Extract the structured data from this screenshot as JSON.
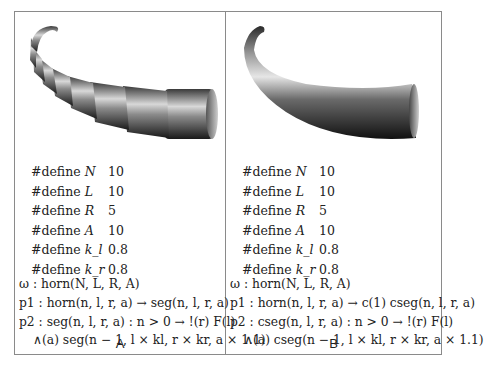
{
  "figure": {
    "panels": [
      {
        "label": "A",
        "render_description": "segmented horn built from discrete cylinder segments",
        "defines": [
          {
            "keyword": "#define",
            "symbol": "N",
            "value": "10"
          },
          {
            "keyword": "#define",
            "symbol": "L",
            "value": "10"
          },
          {
            "keyword": "#define",
            "symbol": "R",
            "value": "5"
          },
          {
            "keyword": "#define",
            "symbol": "A",
            "value": "10"
          },
          {
            "keyword": "#define",
            "symbol": "k_l",
            "value": "0.8"
          },
          {
            "keyword": "#define",
            "symbol": "k_r",
            "value": "0.8"
          }
        ],
        "productions": [
          "ω : horn(N, L, R, A)",
          "p1 : horn(n, l, r, a) → seg(n, l, r, a)",
          "p2 : seg(n, l, r, a) : n > 0 → !(r) F(l)",
          "∧(a) seg(n − 1, l × kl, r × kr, a × 1.1)"
        ]
      },
      {
        "label": "B",
        "render_description": "smooth continuous horn using generalized cylinders",
        "defines": [
          {
            "keyword": "#define",
            "symbol": "N",
            "value": "10"
          },
          {
            "keyword": "#define",
            "symbol": "L",
            "value": "10"
          },
          {
            "keyword": "#define",
            "symbol": "R",
            "value": "5"
          },
          {
            "keyword": "#define",
            "symbol": "A",
            "value": "10"
          },
          {
            "keyword": "#define",
            "symbol": "k_l",
            "value": "0.8"
          },
          {
            "keyword": "#define",
            "symbol": "k_r",
            "value": "0.8"
          }
        ],
        "productions": [
          "ω : horn(N, L, R, A)",
          "p1 : horn(n, l, r, a) → c(1) cseg(n, l, r, a)",
          "p2 : cseg(n, l, r, a) : n > 0 → !(r) F(l)",
          "∧(a) cseg(n − 1, l × kl, r × kr, a × 1.1)"
        ]
      }
    ]
  }
}
